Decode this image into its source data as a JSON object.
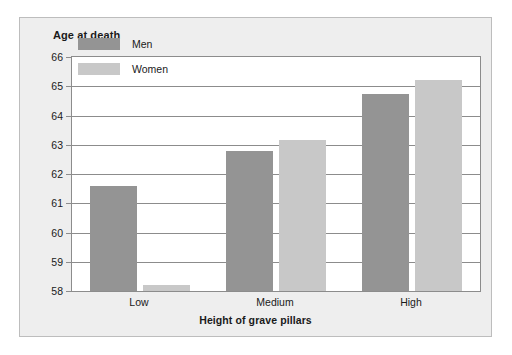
{
  "chart_data": {
    "type": "bar",
    "title": "",
    "ylabel": "Age at death",
    "xlabel": "Height of grave pillars",
    "categories": [
      "Low",
      "Medium",
      "High"
    ],
    "series": [
      {
        "name": "Men",
        "color": "#949494",
        "values": [
          61.6,
          62.8,
          64.75
        ]
      },
      {
        "name": "Women",
        "color": "#c8c8c8",
        "values": [
          58.2,
          63.15,
          65.2
        ]
      }
    ],
    "ylim": [
      58,
      66
    ],
    "ytick_step": 1,
    "yticks": [
      58,
      59,
      60,
      61,
      62,
      63,
      64,
      65,
      66
    ],
    "ytick_labels": [
      "58",
      "59",
      "60",
      "61",
      "62",
      "63",
      "64",
      "65",
      "66"
    ],
    "grid": true,
    "grid_axis": "y",
    "legend_position": "upper-left-inside",
    "panel_background": "#eeeeee",
    "plot_background": "#ffffff",
    "axis_color": "#8c8c8c",
    "text_color": "#1a1a1a"
  }
}
